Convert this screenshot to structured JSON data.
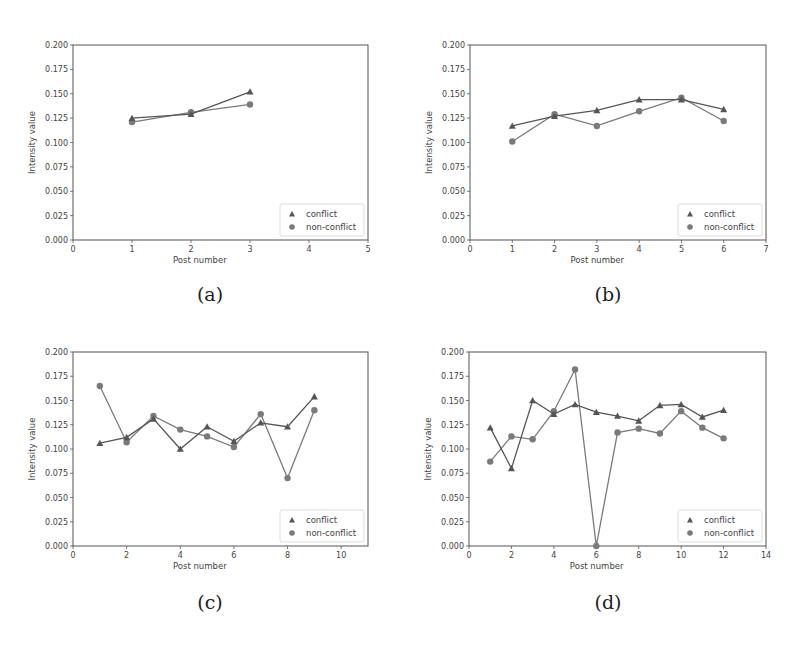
{
  "figure": {
    "captions": [
      "(a)",
      "(b)",
      "(c)",
      "(d)"
    ]
  },
  "colors": {
    "conflict": "#555555",
    "non_conflict": "#7a7a7a",
    "axis": "#555555",
    "legend_border": "#dddddd"
  },
  "chart_data": [
    {
      "type": "line",
      "panel": "(a)",
      "title": "",
      "xlabel": "Post number",
      "ylabel": "Intensity value",
      "xlim": [
        0,
        5
      ],
      "ylim": [
        0.0,
        0.2
      ],
      "xticks": [
        0,
        1,
        2,
        3,
        4,
        5
      ],
      "yticks": [
        0.0,
        0.025,
        0.05,
        0.075,
        0.1,
        0.125,
        0.15,
        0.175,
        0.2
      ],
      "x": [
        1,
        2,
        3
      ],
      "series": [
        {
          "name": "conflict",
          "marker": "triangle",
          "values": [
            0.125,
            0.129,
            0.152
          ]
        },
        {
          "name": "non-conflict",
          "marker": "circle",
          "values": [
            0.121,
            0.131,
            0.139
          ]
        }
      ],
      "legend_position": "lower right",
      "grid": false
    },
    {
      "type": "line",
      "panel": "(b)",
      "title": "",
      "xlabel": "Post number",
      "ylabel": "Intensity value",
      "xlim": [
        0,
        7
      ],
      "ylim": [
        0.0,
        0.2
      ],
      "xticks": [
        0,
        1,
        2,
        3,
        4,
        5,
        6,
        7
      ],
      "yticks": [
        0.0,
        0.025,
        0.05,
        0.075,
        0.1,
        0.125,
        0.15,
        0.175,
        0.2
      ],
      "x": [
        1,
        2,
        3,
        4,
        5,
        6
      ],
      "series": [
        {
          "name": "conflict",
          "marker": "triangle",
          "values": [
            0.117,
            0.127,
            0.133,
            0.144,
            0.144,
            0.134
          ]
        },
        {
          "name": "non-conflict",
          "marker": "circle",
          "values": [
            0.101,
            0.129,
            0.117,
            0.132,
            0.146,
            0.122
          ]
        }
      ],
      "legend_position": "lower right",
      "grid": false
    },
    {
      "type": "line",
      "panel": "(c)",
      "title": "",
      "xlabel": "Post number",
      "ylabel": "Intensity value",
      "xlim": [
        0,
        11
      ],
      "ylim": [
        0.0,
        0.2
      ],
      "xticks": [
        0,
        2,
        4,
        6,
        8,
        10
      ],
      "yticks": [
        0.0,
        0.025,
        0.05,
        0.075,
        0.1,
        0.125,
        0.15,
        0.175,
        0.2
      ],
      "x": [
        1,
        2,
        3,
        4,
        5,
        6,
        7,
        8,
        9
      ],
      "series": [
        {
          "name": "conflict",
          "marker": "triangle",
          "values": [
            0.106,
            0.112,
            0.131,
            0.1,
            0.123,
            0.108,
            0.127,
            0.123,
            0.154
          ]
        },
        {
          "name": "non-conflict",
          "marker": "circle",
          "values": [
            0.165,
            0.107,
            0.134,
            0.12,
            0.113,
            0.102,
            0.136,
            0.07,
            0.14
          ]
        }
      ],
      "legend_position": "lower right",
      "grid": false
    },
    {
      "type": "line",
      "panel": "(d)",
      "title": "",
      "xlabel": "Post number",
      "ylabel": "Intensity value",
      "xlim": [
        0,
        14
      ],
      "ylim": [
        0.0,
        0.2
      ],
      "xticks": [
        0,
        2,
        4,
        6,
        8,
        10,
        12,
        14
      ],
      "yticks": [
        0.0,
        0.025,
        0.05,
        0.075,
        0.1,
        0.125,
        0.15,
        0.175,
        0.2
      ],
      "x": [
        1,
        2,
        3,
        4,
        5,
        6,
        7,
        8,
        9,
        10,
        11,
        12
      ],
      "series": [
        {
          "name": "conflict",
          "marker": "triangle",
          "values": [
            0.122,
            0.08,
            0.15,
            0.136,
            0.146,
            0.138,
            0.134,
            0.129,
            0.145,
            0.146,
            0.133,
            0.14
          ]
        },
        {
          "name": "non-conflict",
          "marker": "circle",
          "values": [
            0.087,
            0.113,
            0.11,
            0.139,
            0.182,
            0.0,
            0.117,
            0.121,
            0.116,
            0.139,
            0.122,
            0.111
          ]
        }
      ],
      "legend_position": "lower right",
      "grid": false
    }
  ]
}
